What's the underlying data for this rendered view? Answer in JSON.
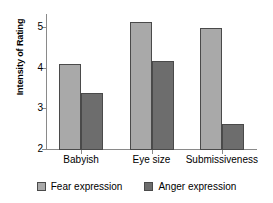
{
  "chart_data": {
    "type": "bar",
    "title": "",
    "xlabel": "",
    "ylabel": "Intensity of Rating",
    "categories": [
      "Babyish",
      "Eye size",
      "Submissiveness"
    ],
    "series": [
      {
        "name": "Fear expression",
        "values": [
          4.13,
          5.15,
          5.0
        ],
        "color": "#a9a9a9"
      },
      {
        "name": "Anger expression",
        "values": [
          3.4,
          4.2,
          2.63
        ],
        "color": "#6d6d6d"
      }
    ],
    "ylim": [
      2,
      5.35
    ],
    "yticks": [
      2,
      3,
      4,
      5
    ],
    "ytick_labels": [
      "2",
      "3",
      "4",
      "5"
    ],
    "grid": false,
    "legend_position": "bottom"
  },
  "legend": {
    "items": [
      {
        "label": "Fear expression"
      },
      {
        "label": "Anger expression"
      }
    ]
  }
}
